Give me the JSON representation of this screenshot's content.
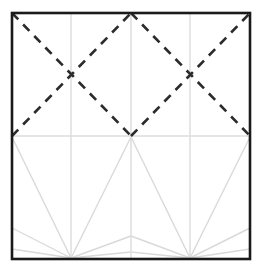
{
  "figure": {
    "name": "origami-crease-pattern",
    "title": "",
    "background_color": "#ffffff",
    "canvas": {
      "width": 262,
      "height": 272
    }
  },
  "colors": {
    "border": "#1a1a1a",
    "mountain_dashed": "#2b2b2b",
    "grid_light": "#dcdcdc",
    "fan_light": "#d9d9d9",
    "background": "#ffffff"
  },
  "frame": {
    "label": "paper-boundary",
    "x": 12,
    "y": 13,
    "width": 238,
    "height": 246,
    "stroke_width": 2.6,
    "stroke": "#1a1a1a"
  },
  "geometry": {
    "left": 12,
    "right": 250,
    "top": 13,
    "bottom": 259,
    "mid_y": 136,
    "col_x": [
      12,
      71,
      131,
      190,
      250
    ],
    "fan_apex_left": {
      "x": 71,
      "y": 258
    },
    "fan_apex_right": {
      "x": 190,
      "y": 258
    },
    "x_center_left": {
      "x": 71,
      "y": 74
    },
    "x_center_right": {
      "x": 190,
      "y": 74
    }
  },
  "grid_lines": {
    "label": "light-grid",
    "stroke": "#dcdcdc",
    "stroke_width": 1.4,
    "segments": [
      {
        "name": "vertical-col1",
        "x1": 71,
        "y1": 13,
        "x2": 71,
        "y2": 259
      },
      {
        "name": "vertical-col2-center",
        "x1": 131,
        "y1": 13,
        "x2": 131,
        "y2": 259
      },
      {
        "name": "vertical-col3",
        "x1": 190,
        "y1": 13,
        "x2": 190,
        "y2": 259
      },
      {
        "name": "horizontal-midline",
        "x1": 12,
        "y1": 136,
        "x2": 250,
        "y2": 136
      }
    ]
  },
  "dashed_lines": {
    "label": "mountain-valley-diagonals",
    "stroke": "#2b2b2b",
    "stroke_width": 2.6,
    "dash_pattern": "9 7",
    "segments": [
      {
        "name": "diag-tl-to-center-left",
        "x1": 12,
        "y1": 13,
        "x2": 131,
        "y2": 136
      },
      {
        "name": "diag-center-left-up",
        "x1": 12,
        "y1": 136,
        "x2": 131,
        "y2": 13
      },
      {
        "name": "diag-center-to-tr",
        "x1": 131,
        "y1": 13,
        "x2": 250,
        "y2": 136
      },
      {
        "name": "diag-center-right-up",
        "x1": 131,
        "y1": 136,
        "x2": 250,
        "y2": 13
      }
    ]
  },
  "fan_lines": {
    "label": "radiating-creases-lower-half",
    "stroke": "#d9d9d9",
    "stroke_width": 1.4,
    "left_fan": {
      "apex": {
        "x": 71,
        "y": 258
      },
      "endpoints": [
        {
          "name": "fan-l-to-topleft-corner",
          "x": 12,
          "y": 137
        },
        {
          "name": "fan-l-to-left-upper",
          "x": 12,
          "y": 228
        },
        {
          "name": "fan-l-to-left-lower",
          "x": 12,
          "y": 249
        },
        {
          "name": "fan-l-to-midline-center",
          "x": 131,
          "y": 137
        },
        {
          "name": "fan-l-to-mid-right-down",
          "x": 131,
          "y": 236
        },
        {
          "name": "fan-l-to-mid-right-low",
          "x": 131,
          "y": 252
        }
      ]
    },
    "right_fan": {
      "apex": {
        "x": 190,
        "y": 258
      },
      "endpoints": [
        {
          "name": "fan-r-to-topright-corner",
          "x": 250,
          "y": 137
        },
        {
          "name": "fan-r-to-right-upper",
          "x": 250,
          "y": 228
        },
        {
          "name": "fan-r-to-right-lower",
          "x": 250,
          "y": 249
        },
        {
          "name": "fan-r-to-midline-center",
          "x": 131,
          "y": 137
        },
        {
          "name": "fan-r-to-mid-left-down",
          "x": 131,
          "y": 236
        },
        {
          "name": "fan-r-to-mid-left-low",
          "x": 131,
          "y": 252
        }
      ]
    }
  }
}
